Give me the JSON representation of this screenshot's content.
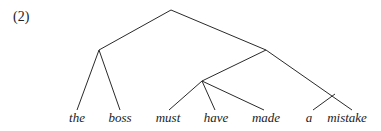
{
  "example_number": "(2)",
  "tree": {
    "nodes": [
      {
        "id": "root",
        "x": 171,
        "y": 10
      },
      {
        "id": "subj",
        "x": 99,
        "y": 50
      },
      {
        "id": "pred",
        "x": 266,
        "y": 50
      },
      {
        "id": "aux",
        "x": 202,
        "y": 81
      },
      {
        "id": "obj",
        "x": 335,
        "y": 94
      }
    ],
    "leaves": [
      {
        "id": "the",
        "label": "the",
        "x": 77,
        "y": 117,
        "tx": 77,
        "ty": 110
      },
      {
        "id": "boss",
        "label": "boss",
        "x": 120,
        "y": 117,
        "tx": 120,
        "ty": 110
      },
      {
        "id": "must",
        "label": "must",
        "x": 168,
        "y": 117,
        "tx": 169,
        "ty": 110
      },
      {
        "id": "have",
        "label": "have",
        "x": 216,
        "y": 117,
        "tx": 215,
        "ty": 110
      },
      {
        "id": "made",
        "label": "made",
        "x": 266,
        "y": 117,
        "tx": 264,
        "ty": 110
      },
      {
        "id": "a",
        "label": "a",
        "x": 309,
        "y": 117,
        "tx": 313,
        "ty": 110
      },
      {
        "id": "mistake",
        "label": "mistake",
        "x": 347,
        "y": 117,
        "tx": 352,
        "ty": 110
      }
    ],
    "edges": [
      [
        "root",
        "subj"
      ],
      [
        "root",
        "pred"
      ],
      [
        "subj",
        "the"
      ],
      [
        "subj",
        "boss"
      ],
      [
        "pred",
        "aux"
      ],
      [
        "pred",
        "mistake"
      ],
      [
        "aux",
        "must"
      ],
      [
        "aux",
        "have"
      ],
      [
        "aux",
        "made"
      ],
      [
        "obj",
        "a"
      ]
    ]
  }
}
